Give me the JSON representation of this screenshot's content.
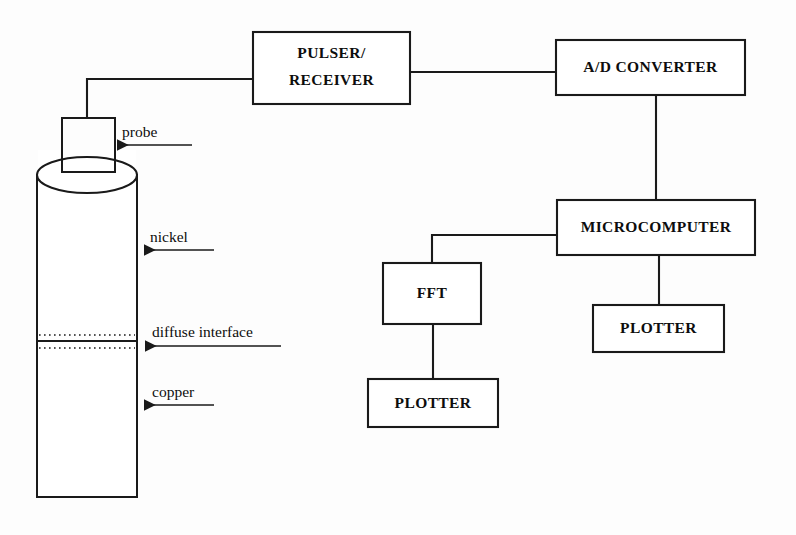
{
  "diagram": {
    "colors": {
      "stroke": "#1a1a1a",
      "background": "#ffffff",
      "text": "#0d0d0d"
    },
    "blocks": [
      {
        "id": "pulser",
        "label_line1": "PULSER/",
        "label_line2": "RECEIVER",
        "x": 253,
        "y": 32,
        "w": 157,
        "h": 72
      },
      {
        "id": "adc",
        "label_line1": "A/D CONVERTER",
        "label_line2": "",
        "x": 556,
        "y": 40,
        "w": 189,
        "h": 55
      },
      {
        "id": "microcomputer",
        "label_line1": "MICROCOMPUTER",
        "label_line2": "",
        "x": 557,
        "y": 200,
        "w": 198,
        "h": 55
      },
      {
        "id": "fft",
        "label_line1": "FFT",
        "label_line2": "",
        "x": 383,
        "y": 263,
        "w": 98,
        "h": 61
      },
      {
        "id": "plotter-right",
        "label_line1": "PLOTTER",
        "label_line2": "",
        "x": 593,
        "y": 305,
        "w": 131,
        "h": 47
      },
      {
        "id": "plotter-bottom",
        "label_line1": "PLOTTER",
        "label_line2": "",
        "x": 368,
        "y": 379,
        "w": 130,
        "h": 48
      }
    ],
    "specimen": {
      "name": "layered-cylinder-specimen",
      "left": 37,
      "right": 137,
      "top_ellipse_cy": 175,
      "top_ellipse_ry": 18,
      "bottom": 497,
      "interface_dotted_upper_y": 335,
      "interface_solid_y": 341,
      "interface_dotted_lower_y": 348
    },
    "probe": {
      "name": "probe-transducer",
      "x": 62,
      "y": 118,
      "w": 53,
      "h": 54
    },
    "callouts": [
      {
        "id": "probe",
        "label": "probe",
        "label_x": 122,
        "label_y": 137,
        "arrow_y": 145,
        "arrow_from_x": 192,
        "arrow_to_x": 112
      },
      {
        "id": "nickel",
        "label": "nickel",
        "label_x": 150,
        "label_y": 242,
        "arrow_y": 250,
        "arrow_from_x": 214,
        "arrow_to_x": 139
      },
      {
        "id": "diffuse-interface",
        "label": "diffuse interface",
        "label_x": 152,
        "label_y": 337,
        "arrow_y": 346,
        "arrow_from_x": 281,
        "arrow_to_x": 140
      },
      {
        "id": "copper",
        "label": "copper",
        "label_x": 152,
        "label_y": 397,
        "arrow_y": 405,
        "arrow_from_x": 214,
        "arrow_to_x": 139
      }
    ],
    "wires": [
      {
        "id": "probe-to-pulser",
        "path": "M 87 118 L 87 79 L 253 79"
      },
      {
        "id": "pulser-to-adc",
        "path": "M 410 72 L 556 72"
      },
      {
        "id": "adc-to-microcomputer",
        "path": "M 656 95 L 656 200"
      },
      {
        "id": "microcomputer-to-fft",
        "path": "M 557 235 L 432 235 L 432 263"
      },
      {
        "id": "microcomputer-to-plotter-right",
        "path": "M 659 255 L 659 305"
      },
      {
        "id": "fft-to-plotter-bottom",
        "path": "M 433 324 L 433 379"
      }
    ]
  }
}
